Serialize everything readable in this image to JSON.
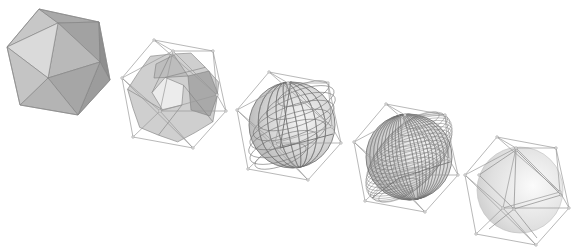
{
  "diagram": {
    "title": "",
    "background": "#ffffff",
    "stage_offset": [
      116,
      32
    ],
    "stages": [
      {
        "id": 1,
        "label": "icosahedron",
        "show_cage": false,
        "render": "faceted-icosahedron",
        "origin": [
          0,
          0
        ]
      },
      {
        "id": 2,
        "label": "subdivision-level-1",
        "show_cage": true,
        "render": "truncated-polyhedron",
        "origin": [
          154,
          40
        ]
      },
      {
        "id": 3,
        "label": "subdivision-level-2",
        "show_cage": true,
        "render": "coarse-grid-sphere",
        "origin": [
          269,
          72
        ],
        "grid_density": 9
      },
      {
        "id": 4,
        "label": "subdivision-level-3",
        "show_cage": true,
        "render": "fine-grid-sphere",
        "origin": [
          386,
          104
        ],
        "grid_density": 22
      },
      {
        "id": 5,
        "label": "limit-surface",
        "show_cage": true,
        "render": "smooth-sphere-with-overlay",
        "origin": [
          497,
          137
        ]
      }
    ],
    "cage": {
      "vertices": [
        [
          0,
          0
        ],
        [
          19,
          11
        ],
        [
          59,
          11
        ],
        [
          -32,
          38
        ],
        [
          63,
          55
        ],
        [
          72,
          71
        ],
        [
          6,
          71
        ],
        [
          -21,
          97
        ],
        [
          39,
          108
        ]
      ],
      "edges": [
        [
          0,
          1
        ],
        [
          0,
          2
        ],
        [
          0,
          3
        ],
        [
          1,
          2
        ],
        [
          1,
          3
        ],
        [
          1,
          6
        ],
        [
          2,
          4
        ],
        [
          2,
          5
        ],
        [
          1,
          4
        ],
        [
          3,
          6
        ],
        [
          3,
          7
        ],
        [
          4,
          5
        ],
        [
          4,
          6
        ],
        [
          5,
          6
        ],
        [
          5,
          8
        ],
        [
          6,
          7
        ],
        [
          6,
          8
        ],
        [
          7,
          8
        ],
        [
          0,
          4
        ],
        [
          3,
          8
        ]
      ]
    },
    "icosahedron": {
      "outline": [
        [
          39,
          9
        ],
        [
          99,
          22
        ],
        [
          110,
          80
        ],
        [
          78,
          115
        ],
        [
          20,
          105
        ],
        [
          7,
          47
        ]
      ],
      "faces": [
        {
          "pts": [
            [
              39,
              9
            ],
            [
              58,
              23
            ],
            [
              7,
              47
            ]
          ],
          "fill": "#c7c7c7"
        },
        {
          "pts": [
            [
              39,
              9
            ],
            [
              99,
              22
            ],
            [
              58,
              23
            ]
          ],
          "fill": "#a9a9a9"
        },
        {
          "pts": [
            [
              58,
              23
            ],
            [
              99,
              22
            ],
            [
              100,
              62
            ]
          ],
          "fill": "#a2a2a2"
        },
        {
          "pts": [
            [
              58,
              23
            ],
            [
              100,
              62
            ],
            [
              48,
              78
            ]
          ],
          "fill": "#b9b9b9"
        },
        {
          "pts": [
            [
              7,
              47
            ],
            [
              58,
              23
            ],
            [
              48,
              78
            ]
          ],
          "fill": "#dadada"
        },
        {
          "pts": [
            [
              99,
              22
            ],
            [
              110,
              80
            ],
            [
              100,
              62
            ]
          ],
          "fill": "#8f8f8f"
        },
        {
          "pts": [
            [
              100,
              62
            ],
            [
              110,
              80
            ],
            [
              78,
              115
            ]
          ],
          "fill": "#9c9c9c"
        },
        {
          "pts": [
            [
              48,
              78
            ],
            [
              100,
              62
            ],
            [
              78,
              115
            ]
          ],
          "fill": "#a6a6a6"
        },
        {
          "pts": [
            [
              20,
              105
            ],
            [
              48,
              78
            ],
            [
              78,
              115
            ]
          ],
          "fill": "#b4b4b4"
        },
        {
          "pts": [
            [
              7,
              47
            ],
            [
              48,
              78
            ],
            [
              20,
              105
            ]
          ],
          "fill": "#c4c4c4"
        }
      ]
    },
    "colors": {
      "cage": "#9a9a9a",
      "surface_light": "#e6e6e6",
      "surface_mid": "#c8c8c8",
      "surface_dark": "#a0a0a0",
      "grid": "#6f6f6f"
    }
  }
}
